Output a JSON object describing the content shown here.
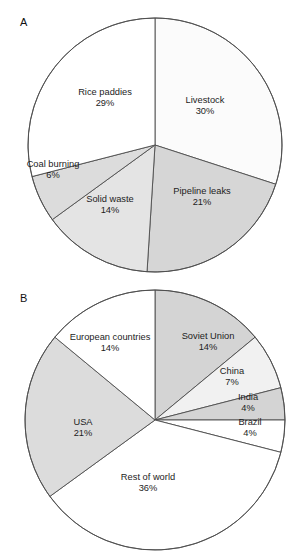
{
  "figure": {
    "panels": [
      {
        "id": "A",
        "label": "A"
      },
      {
        "id": "B",
        "label": "B"
      }
    ]
  },
  "chart_data": [
    {
      "type": "pie",
      "title": "A",
      "panel": "A",
      "start_angle_deg": 0,
      "direction": "clockwise",
      "center": [
        155,
        145
      ],
      "radius": 127,
      "categories": [
        "Livestock",
        "Pipeline leaks",
        "Solid waste",
        "Coal burning",
        "Rice paddies"
      ],
      "values": [
        30,
        21,
        14,
        6,
        29
      ],
      "unit": "%",
      "labels": [
        {
          "name": "Livestock",
          "pct": "30%",
          "value": 30,
          "fill": "#fbfbfb",
          "lx": 205,
          "ly": 106
        },
        {
          "name": "Pipeline leaks",
          "pct": "21%",
          "value": 21,
          "fill": "#d6d6d6",
          "lx": 202,
          "ly": 197
        },
        {
          "name": "Solid waste",
          "pct": "14%",
          "value": 14,
          "fill": "#e4e4e4",
          "lx": 110,
          "ly": 205
        },
        {
          "name": "Coal burning",
          "pct": "6%",
          "value": 6,
          "fill": "#dcdcdc",
          "lx": 53,
          "ly": 170
        },
        {
          "name": "Rice paddies",
          "pct": "29%",
          "value": 29,
          "fill": "#ffffff",
          "lx": 105,
          "ly": 98
        }
      ],
      "legend": "none",
      "grid": false
    },
    {
      "type": "pie",
      "title": "B",
      "panel": "B",
      "start_angle_deg": 0,
      "direction": "clockwise",
      "center": [
        155,
        420
      ],
      "radius": 130,
      "categories": [
        "Soviet Union",
        "China",
        "India",
        "Brazil",
        "Rest of world",
        "USA",
        "European countries"
      ],
      "values": [
        14,
        7,
        4,
        4,
        36,
        21,
        14
      ],
      "unit": "%",
      "labels": [
        {
          "name": "Soviet Union",
          "pct": "14%",
          "value": 14,
          "fill": "#d4d4d4",
          "lx": 208,
          "ly": 342
        },
        {
          "name": "China",
          "pct": "7%",
          "value": 7,
          "fill": "#f1f1f1",
          "lx": 232,
          "ly": 377
        },
        {
          "name": "India",
          "pct": "4%",
          "value": 4,
          "fill": "#d4d4d4",
          "lx": 248,
          "ly": 403
        },
        {
          "name": "Brazil",
          "pct": "4%",
          "value": 4,
          "fill": "#ffffff",
          "lx": 250,
          "ly": 428
        },
        {
          "name": "Rest of world",
          "pct": "36%",
          "value": 36,
          "fill": "#ffffff",
          "lx": 148,
          "ly": 483
        },
        {
          "name": "USA",
          "pct": "21%",
          "value": 21,
          "fill": "#dcdcdc",
          "lx": 83,
          "ly": 428
        },
        {
          "name": "European countries",
          "pct": "14%",
          "value": 14,
          "fill": "#ffffff",
          "lx": 110,
          "ly": 343
        }
      ],
      "legend": "none",
      "grid": false
    }
  ]
}
